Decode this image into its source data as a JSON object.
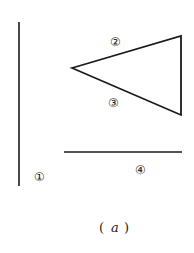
{
  "figure": {
    "caption_letter": "a",
    "caption_open": "(",
    "caption_close": ")",
    "stroke_color": "#1a1a1a",
    "background": "#ffffff"
  },
  "elements": [
    {
      "id": 1,
      "label": "①",
      "shape": "vertical-line"
    },
    {
      "id": 2,
      "label": "②",
      "shape": "triangle-upper-edge"
    },
    {
      "id": 3,
      "label": "③",
      "shape": "triangle-lower-edge"
    },
    {
      "id": 4,
      "label": "④",
      "shape": "horizontal-line"
    }
  ]
}
